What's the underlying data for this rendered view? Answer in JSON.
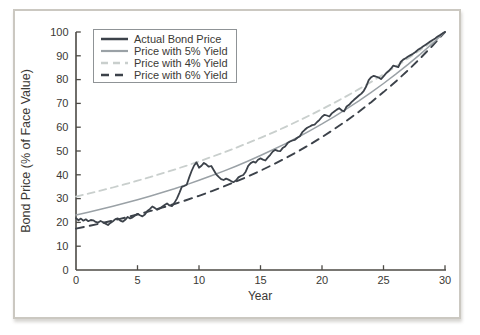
{
  "figure": {
    "kind": "line-chart-figure",
    "background": "#ffffff"
  },
  "colors": {
    "axis": "#4c4a45",
    "text": "#3b3935",
    "figure_border": "#cbc8c1",
    "legend_border": "#8f9396"
  },
  "chart_data": {
    "type": "line",
    "title": "",
    "xlabel": "Year",
    "ylabel": "Bond Price (% of Face Value)",
    "xlim": [
      0,
      30
    ],
    "ylim": [
      0,
      100
    ],
    "xticks": [
      0,
      5,
      10,
      15,
      20,
      25,
      30
    ],
    "yticks": [
      0,
      10,
      20,
      30,
      40,
      50,
      60,
      70,
      80,
      90,
      100
    ],
    "grid": false,
    "legend_position": "top-left-inside",
    "draw_order": [
      2,
      3,
      1,
      0
    ],
    "series": [
      {
        "name": "Actual Bond Price",
        "style": "solid",
        "color": "#3c424a",
        "width": 1.8,
        "dash": null,
        "x_start": 0,
        "x_step": 0.2,
        "values": [
          21.8,
          20.9,
          21.6,
          20.7,
          21.3,
          20.5,
          21.0,
          20.9,
          20.2,
          19.9,
          20.6,
          20.1,
          19.5,
          18.9,
          19.8,
          20.5,
          21.4,
          21.7,
          20.7,
          20.3,
          21.1,
          22.3,
          21.7,
          22.1,
          22.9,
          23.6,
          23.0,
          22.5,
          23.3,
          24.8,
          25.6,
          26.7,
          26.1,
          25.3,
          25.9,
          26.6,
          27.3,
          28.0,
          27.1,
          26.8,
          28.2,
          30.0,
          32.3,
          34.9,
          35.3,
          35.8,
          38.9,
          41.6,
          43.9,
          45.2,
          43.0,
          43.8,
          45.0,
          44.3,
          43.4,
          43.7,
          41.9,
          40.2,
          39.1,
          38.2,
          37.8,
          38.4,
          38.0,
          37.4,
          36.9,
          37.6,
          38.9,
          39.5,
          39.9,
          41.3,
          43.8,
          44.9,
          45.5,
          45.1,
          46.3,
          46.9,
          46.4,
          46.0,
          47.3,
          48.4,
          49.8,
          50.5,
          50.1,
          49.9,
          51.2,
          51.9,
          53.3,
          54.0,
          54.4,
          54.7,
          55.6,
          56.2,
          57.9,
          58.9,
          59.8,
          60.3,
          60.9,
          61.1,
          62.2,
          63.1,
          64.4,
          65.2,
          64.9,
          64.5,
          65.8,
          66.6,
          67.4,
          68.0,
          67.1,
          66.7,
          68.7,
          69.4,
          70.5,
          71.5,
          72.4,
          73.3,
          74.1,
          75.3,
          77.2,
          79.8,
          81.0,
          81.6,
          81.2,
          80.9,
          80.2,
          81.4,
          82.6,
          83.5,
          84.6,
          85.9,
          85.6,
          85.2,
          87.4,
          88.4,
          89.0,
          89.7,
          90.3,
          90.9,
          91.6,
          92.5,
          93.1,
          93.9,
          94.6,
          95.3,
          96.0,
          96.7,
          97.3,
          98.1,
          98.7,
          99.4,
          100.0
        ]
      },
      {
        "name": "Price with 5% Yield",
        "style": "solid",
        "color": "#9aa1a6",
        "width": 1.5,
        "dash": null,
        "x_start": 0,
        "x_step": 1,
        "values": [
          23.14,
          24.29,
          25.51,
          26.78,
          28.12,
          29.53,
          31.01,
          32.56,
          34.18,
          35.89,
          37.69,
          39.57,
          41.55,
          43.63,
          45.81,
          48.1,
          50.51,
          53.03,
          55.68,
          58.47,
          61.39,
          64.46,
          67.68,
          71.07,
          74.62,
          78.35,
          82.27,
          86.38,
          90.7,
          95.24,
          100.0
        ]
      },
      {
        "name": "Price with 4% Yield",
        "style": "dashed",
        "color": "#c9cfcd",
        "width": 1.8,
        "dash": "7 5",
        "x_start": 0,
        "x_step": 1,
        "values": [
          30.83,
          32.07,
          33.35,
          34.68,
          36.07,
          37.51,
          39.01,
          40.57,
          42.2,
          43.88,
          45.64,
          47.46,
          49.36,
          51.34,
          53.39,
          55.53,
          57.75,
          60.06,
          62.46,
          64.96,
          67.56,
          70.26,
          73.07,
          75.99,
          79.03,
          82.19,
          85.48,
          88.9,
          92.46,
          96.15,
          100.0
        ]
      },
      {
        "name": "Price with 6% Yield",
        "style": "dashed",
        "color": "#3c424a",
        "width": 1.9,
        "dash": "8 6",
        "x_start": 0,
        "x_step": 1,
        "values": [
          17.41,
          18.46,
          19.56,
          20.74,
          21.98,
          23.3,
          24.7,
          26.18,
          27.75,
          29.42,
          31.18,
          33.05,
          35.03,
          37.14,
          39.36,
          41.73,
          44.23,
          46.88,
          49.7,
          52.68,
          55.84,
          59.19,
          62.74,
          66.51,
          70.5,
          74.73,
          79.21,
          83.96,
          89.0,
          94.34,
          100.0
        ]
      }
    ]
  }
}
